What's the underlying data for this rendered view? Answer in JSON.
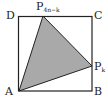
{
  "diagram": {
    "labels": {
      "A": "A",
      "B": "B",
      "C": "C",
      "D": "D",
      "P_top": "P",
      "P_top_sub": "4n−k",
      "P_right": "P",
      "P_right_sub": "k"
    },
    "colors": {
      "stroke": "#222222",
      "fill": "#a9a9a9"
    },
    "shapes": {
      "square": "ABCD",
      "triangle": [
        "A",
        "P_{4n-k}",
        "P_k"
      ]
    }
  }
}
